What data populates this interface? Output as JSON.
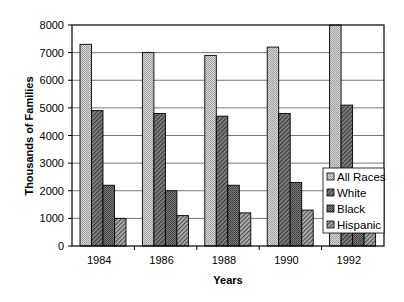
{
  "chart_data": {
    "type": "bar",
    "title": "",
    "xlabel": "Years",
    "ylabel": "Thousands of Families",
    "ylim": [
      0,
      8000
    ],
    "yticks": [
      0,
      1000,
      2000,
      3000,
      4000,
      5000,
      6000,
      7000,
      8000
    ],
    "grid": true,
    "legend_position": "lower right, inside plot",
    "categories": [
      "1984",
      "1986",
      "1988",
      "1990",
      "1992"
    ],
    "series": [
      {
        "name": "All Races",
        "values": [
          7300,
          7000,
          6900,
          7200,
          8000
        ],
        "color": "#c8c8c8",
        "pattern": "dots"
      },
      {
        "name": "White",
        "values": [
          4900,
          4800,
          4700,
          4800,
          5100
        ],
        "color": "#6e6e6e",
        "pattern": "diag-dense"
      },
      {
        "name": "Black",
        "values": [
          2200,
          2000,
          2200,
          2300,
          2500
        ],
        "color": "#5a5a5a",
        "pattern": "crosshatch"
      },
      {
        "name": "Hispanic",
        "values": [
          1000,
          1100,
          1200,
          1300,
          1400
        ],
        "color": "#8a8a8a",
        "pattern": "diag"
      }
    ]
  },
  "legend": {
    "items": [
      "All Races",
      "White",
      "Black",
      "Hispanic"
    ]
  },
  "axes": {
    "x_title": "Years",
    "y_title": "Thousands of Families"
  }
}
